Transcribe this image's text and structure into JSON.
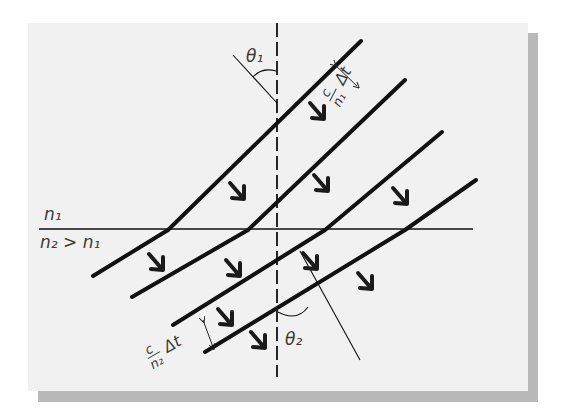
{
  "figure": {
    "colors": {
      "panel": "#f1f1f1",
      "shadow": "#b9b9b9",
      "ink": "#111111",
      "label": "#3a3a3a"
    },
    "labels": {
      "medium_top": "n₁",
      "medium_bottom": "n₂ > n₁",
      "theta1": "θ₁",
      "theta2": "θ₂",
      "spacing_top_num": "c",
      "spacing_top_den": "n₁",
      "spacing_top_dt": "Δt",
      "spacing_bottom_num": "c",
      "spacing_bottom_den": "n₂",
      "spacing_bottom_dt": "Δt"
    },
    "interface": {
      "x1": 39,
      "y1": 229,
      "x2": 473,
      "y2": 229
    },
    "normal": {
      "x": 277,
      "y1": 23,
      "y2": 377
    },
    "wavefronts": [
      {
        "top": [
          361,
          41
        ],
        "kink": [
          168,
          230
        ],
        "bottom": [
          93,
          276
        ]
      },
      {
        "top": [
          405,
          80
        ],
        "kink": [
          248,
          230
        ],
        "bottom": [
          132,
          297
        ]
      },
      {
        "top": [
          442,
          132
        ],
        "kink": [
          325,
          230
        ],
        "bottom": [
          173,
          325
        ]
      },
      {
        "top": [
          476,
          180
        ],
        "kink": [
          405,
          230
        ],
        "bottom": [
          205,
          352
        ]
      }
    ],
    "arrows": [
      [
        318,
        112
      ],
      [
        238,
        192
      ],
      [
        322,
        184
      ],
      [
        401,
        197
      ],
      [
        157,
        263
      ],
      [
        234,
        269
      ],
      [
        311,
        262
      ],
      [
        366,
        282
      ],
      [
        226,
        318
      ],
      [
        259,
        341
      ]
    ]
  }
}
